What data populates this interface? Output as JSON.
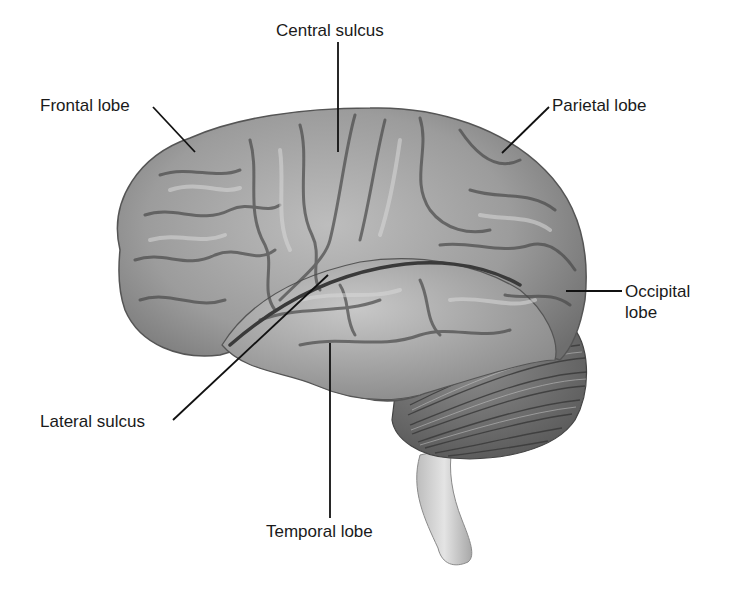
{
  "figure": {
    "colors": {
      "background": "#ffffff",
      "cerebrum_fill": "#9a9a9a",
      "cerebrum_highlight": "#c4c4c4",
      "sulcus_shadow": "#4a4a4a",
      "cerebellum_fill": "#7a7a7a",
      "brainstem_fill": "#cfcfcf",
      "leader_line": "#111111",
      "label_text": "#1a1a1a"
    },
    "labels": [
      {
        "id": "frontal",
        "text": "Frontal lobe"
      },
      {
        "id": "central",
        "text": "Central sulcus"
      },
      {
        "id": "parietal",
        "text": "Parietal lobe"
      },
      {
        "id": "occipital_1",
        "text": "Occipital"
      },
      {
        "id": "occipital_2",
        "text": "lobe"
      },
      {
        "id": "lateral",
        "text": "Lateral sulcus"
      },
      {
        "id": "temporal",
        "text": "Temporal lobe"
      }
    ]
  }
}
